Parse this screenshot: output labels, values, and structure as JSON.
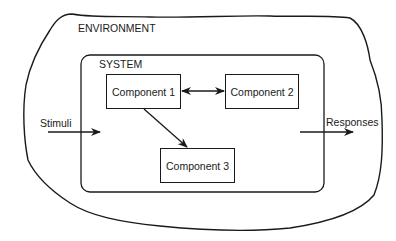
{
  "diagram": {
    "environment": {
      "label": "ENVIRONMENT"
    },
    "system": {
      "label": "SYSTEM"
    },
    "components": [
      {
        "id": "c1",
        "label": "Component 1"
      },
      {
        "id": "c2",
        "label": "Component 2"
      },
      {
        "id": "c3",
        "label": "Component 3"
      }
    ],
    "inputs": {
      "label": "Stimuli"
    },
    "outputs": {
      "label": "Responses"
    },
    "edges": [
      {
        "from": "c1",
        "to": "c2",
        "type": "bidirectional"
      },
      {
        "from": "c1",
        "to": "c3",
        "type": "directed"
      },
      {
        "from": "Stimuli",
        "to": "system",
        "type": "directed"
      },
      {
        "from": "system",
        "to": "Responses",
        "type": "directed"
      }
    ],
    "colors": {
      "stroke": "#1a1a1a",
      "background": "#ffffff"
    }
  }
}
